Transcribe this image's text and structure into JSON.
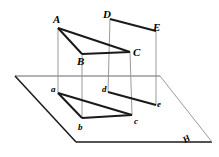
{
  "figure": {
    "background_color": "#ffffff",
    "stroke_color": "#1a1a1a",
    "plane_stroke_color": "#555555",
    "faint_stroke_color": "#8a8a8a",
    "labels": {
      "upper": [
        {
          "id": "A",
          "text": "A",
          "x": 53,
          "y": 14
        },
        {
          "id": "B",
          "text": "B",
          "x": 77,
          "y": 56
        },
        {
          "id": "C",
          "text": "C",
          "x": 133,
          "y": 47
        },
        {
          "id": "D",
          "text": "D",
          "x": 103,
          "y": 9
        },
        {
          "id": "E",
          "text": "E",
          "x": 153,
          "y": 22
        }
      ],
      "lower": [
        {
          "id": "a",
          "text": "a",
          "x": 51,
          "y": 85
        },
        {
          "id": "b",
          "text": "b",
          "x": 78,
          "y": 123
        },
        {
          "id": "c",
          "text": "c",
          "x": 134,
          "y": 117
        },
        {
          "id": "d",
          "text": "d",
          "x": 102,
          "y": 85
        },
        {
          "id": "e",
          "text": "e",
          "x": 157,
          "y": 100
        }
      ],
      "plane": [
        {
          "id": "H",
          "text": "H",
          "x": 186,
          "y": 136
        }
      ]
    },
    "points": {
      "A": {
        "x": 58,
        "y": 28
      },
      "B": {
        "x": 82,
        "y": 54
      },
      "C": {
        "x": 130,
        "y": 52
      },
      "D": {
        "x": 110,
        "y": 19
      },
      "E": {
        "x": 156,
        "y": 31
      },
      "a": {
        "x": 58,
        "y": 93
      },
      "b": {
        "x": 82,
        "y": 118
      },
      "c": {
        "x": 132,
        "y": 115
      },
      "d": {
        "x": 108,
        "y": 92
      },
      "e": {
        "x": 156,
        "y": 105
      }
    },
    "plane_H": {
      "corner_left": {
        "x": 15,
        "y": 76
      },
      "corner_top": {
        "x": 160,
        "y": 76
      },
      "corner_right": {
        "x": 212,
        "y": 142
      },
      "corner_bottom": {
        "x": 76,
        "y": 142
      }
    },
    "edges_upper_solid": [
      {
        "name": "A-B",
        "from": "A",
        "to": "B"
      },
      {
        "name": "A-C",
        "from": "A",
        "to": "C"
      },
      {
        "name": "B-C",
        "from": "B",
        "to": "C"
      },
      {
        "name": "D-E",
        "from": "D",
        "to": "E"
      }
    ],
    "edges_lower_solid": [
      {
        "name": "a-b",
        "from": "a",
        "to": "b"
      },
      {
        "name": "a-c",
        "from": "a",
        "to": "c"
      },
      {
        "name": "b-c",
        "from": "b",
        "to": "c"
      },
      {
        "name": "d-e",
        "from": "d",
        "to": "e"
      }
    ],
    "projector_lines": [
      {
        "name": "A-a",
        "from": "A",
        "to": "a"
      },
      {
        "name": "B-b",
        "from": "B",
        "to": "b"
      },
      {
        "name": "C-c",
        "from": "C",
        "to": "c"
      },
      {
        "name": "D-d",
        "from": "D",
        "to": "d"
      },
      {
        "name": "E-e",
        "from": "E",
        "to": "e"
      }
    ]
  }
}
